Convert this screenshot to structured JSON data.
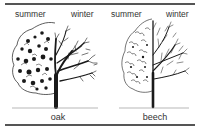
{
  "figure": {
    "panels": [
      {
        "name": "oak",
        "left_label": "summer",
        "right_label": "winter"
      },
      {
        "name": "beech",
        "left_label": "summer",
        "right_label": "winter"
      }
    ]
  },
  "colors": {
    "ink": "#1a1a1a",
    "rule": "#555555",
    "background": "#ffffff"
  }
}
